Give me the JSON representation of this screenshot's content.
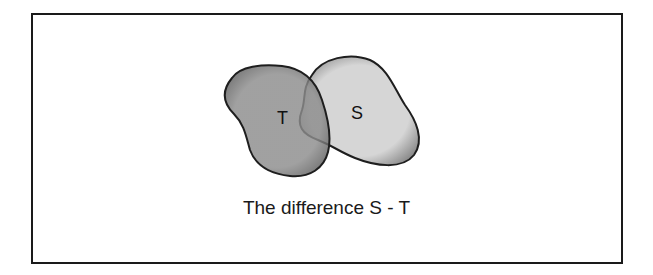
{
  "diagram": {
    "sets": [
      {
        "id": "T",
        "label": "T",
        "fill": "#8a8a8a"
      },
      {
        "id": "S",
        "label": "S",
        "fill": "#d4d4d4"
      }
    ],
    "caption": "The difference S - T"
  }
}
